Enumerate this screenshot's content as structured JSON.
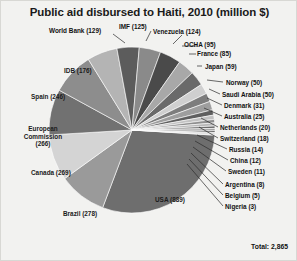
{
  "chart": {
    "title": "Public aid disbursed to Haiti, 2010 (million $)",
    "total_label": "Total: 2,865"
  },
  "labels": {
    "world_bank": "World Bank (129)",
    "imf": "IMF (125)",
    "venezuela": "Venezuela (124)",
    "ocha": "OCHA (95)",
    "france": "France (85)",
    "japan": "Japan (59)",
    "norway": "Norway (50)",
    "saudi_arabia": "Saudi Arabia (50)",
    "denmark": "Denmark (31)",
    "australia": "Australia (25)",
    "netherlands": "Netherlands (20)",
    "switzerland": "Switzerland (18)",
    "russia": "Russia (14)",
    "china": "China (12)",
    "sweden": "Sweden (11)",
    "argentina": "Argentina (8)",
    "belgium": "Belgium (5)",
    "nigeria": "Nigeria (3)",
    "idb": "IDB (176)",
    "spain": "Spain (246)",
    "european_commission_l1": "European",
    "european_commission_l2": "Commission",
    "european_commission_l3": "(266)",
    "canada": "Canada (269)",
    "brazil": "Brazil (278)",
    "usa": "USA (889)"
  },
  "chart_data": {
    "type": "pie",
    "title": "Public aid disbursed to Haiti, 2010 (million $)",
    "unit": "million $",
    "total": 2865,
    "total_label": "Total: 2,865",
    "legend_position": "none (direct labels with leader lines)",
    "grid": false,
    "categories": [
      "USA",
      "Brazil",
      "Canada",
      "European Commission",
      "Spain",
      "IDB",
      "World Bank",
      "IMF",
      "Venezuela",
      "OCHA",
      "France",
      "Japan",
      "Norway",
      "Saudi Arabia",
      "Denmark",
      "Australia",
      "Netherlands",
      "Switzerland",
      "Russia",
      "China",
      "Sweden",
      "Argentina",
      "Belgium",
      "Nigeria"
    ],
    "values": [
      889,
      278,
      269,
      266,
      246,
      176,
      129,
      125,
      124,
      95,
      85,
      59,
      50,
      50,
      31,
      25,
      20,
      18,
      14,
      12,
      11,
      8,
      5,
      3
    ],
    "colors": [
      "#6e6e6e",
      "#9a9a9a",
      "#d4d4d4",
      "#717171",
      "#8d8d8d",
      "#b4b4b4",
      "#5c5c5c",
      "#8a8a8a",
      "#4a4a4a",
      "#a8a8a8",
      "#6a6a6a",
      "#cfcfcf",
      "#7d7d7d",
      "#9e9e9e",
      "#5f5f5f",
      "#c2c2c2",
      "#8f8f8f",
      "#b8b8b8",
      "#6b6b6b",
      "#a2a2a2",
      "#545454",
      "#c8c8c8",
      "#7a7a7a",
      "#9c9c9c"
    ]
  }
}
